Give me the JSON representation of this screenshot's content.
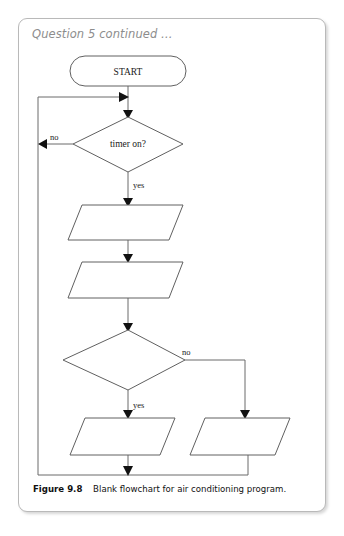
{
  "page": {
    "header_note": "Question 5 continued …",
    "background": "#ffffff",
    "border_color": "#b9b9b9"
  },
  "caption": {
    "label": "Figure 9.8",
    "text": "Blank flowchart for air conditioning program."
  },
  "flowchart": {
    "title": "Blank flowchart for air conditioning program",
    "nodes": [
      {
        "id": "start",
        "type": "terminator",
        "label": "START"
      },
      {
        "id": "decision1",
        "type": "decision",
        "label": "timer on?"
      },
      {
        "id": "io1",
        "type": "parallelogram",
        "label": ""
      },
      {
        "id": "io2",
        "type": "parallelogram",
        "label": ""
      },
      {
        "id": "decision2",
        "type": "decision",
        "label": ""
      },
      {
        "id": "io3",
        "type": "parallelogram",
        "label": ""
      },
      {
        "id": "io4",
        "type": "parallelogram",
        "label": ""
      }
    ],
    "edge_labels": {
      "d1_no": "no",
      "d1_yes": "yes",
      "d2_no": "no",
      "d2_yes": "yes"
    }
  }
}
